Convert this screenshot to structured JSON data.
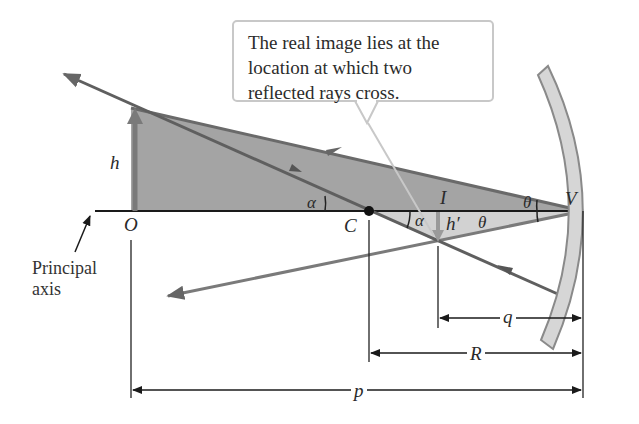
{
  "callout": {
    "lines": [
      "The real image lies at the",
      "location at which two",
      "reflected rays cross."
    ]
  },
  "labels": {
    "object_height": "h",
    "image_height": "h′",
    "object_point": "O",
    "center_of_curvature": "C",
    "image_point": "I",
    "vertex": "V",
    "angle_alpha_upper": "α",
    "angle_alpha_lower": "α",
    "angle_theta_upper": "θ",
    "angle_theta_lower": "θ",
    "principal_axis_line1": "Principal",
    "principal_axis_line2": "axis"
  },
  "dimensions": {
    "image_distance": "q",
    "radius": "R",
    "object_distance": "p"
  },
  "colors": {
    "shaded_triangle": "#9a9a9a",
    "light_triangle": "#d2d2d2",
    "ray": "#5f5f5f",
    "mirror_fill": "#d6d6d6",
    "mirror_edge": "#8a8a8a",
    "axis": "#1a1a1a",
    "callout_border": "#c8c8c8"
  }
}
